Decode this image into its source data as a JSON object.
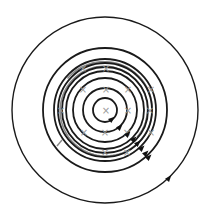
{
  "diagram": {
    "title": "Magnetic field lines around a coil (concentric circles with into-page markers)",
    "center": {
      "x": 105,
      "y": 110
    },
    "colors": {
      "field_line": "#1a1a1a",
      "coil": "#8a8a8a",
      "cross_marker": "#9a9a9a",
      "arrow": "#111111",
      "background": "#ffffff"
    },
    "field_lines": [
      {
        "r": 12,
        "arrow": {
          "x": 112,
          "y": 119,
          "angle": -40
        }
      },
      {
        "r": 22,
        "arrow": {
          "x": 120,
          "y": 127,
          "angle": -45
        }
      },
      {
        "r": 32,
        "arrow": {
          "x": 128,
          "y": 134,
          "angle": -45
        }
      },
      {
        "r": 39,
        "arrow": {
          "x": 134,
          "y": 139,
          "angle": -45
        }
      },
      {
        "r": 43,
        "arrow": {
          "x": 138,
          "y": 143,
          "angle": -45
        }
      },
      {
        "r": 47,
        "arrow": {
          "x": 142,
          "y": 148,
          "angle": -45
        }
      },
      {
        "r": 51,
        "arrow": {
          "x": 146,
          "y": 153,
          "angle": -45
        }
      },
      {
        "r": 62,
        "arrow": {
          "x": 149,
          "y": 157,
          "angle": -45
        }
      },
      {
        "r": 93,
        "arrow": {
          "x": 169,
          "y": 178,
          "angle": -50
        }
      }
    ],
    "coil_spiral": {
      "start_r": 42,
      "end_r": 49,
      "start_angle": -40,
      "end_angle": 140,
      "tail": {
        "x1": 62,
        "y1": 140,
        "x2": 57,
        "y2": 146
      }
    },
    "cross_markers": [
      {
        "x": 83,
        "y": 68
      },
      {
        "x": 106,
        "y": 68
      },
      {
        "x": 83,
        "y": 89
      },
      {
        "x": 106,
        "y": 89
      },
      {
        "x": 128,
        "y": 89
      },
      {
        "x": 151,
        "y": 89
      },
      {
        "x": 61,
        "y": 110
      },
      {
        "x": 106,
        "y": 110
      },
      {
        "x": 128,
        "y": 110
      },
      {
        "x": 150,
        "y": 110
      },
      {
        "x": 84,
        "y": 132
      },
      {
        "x": 105,
        "y": 132
      },
      {
        "x": 127,
        "y": 132
      },
      {
        "x": 151,
        "y": 132
      },
      {
        "x": 105,
        "y": 152
      },
      {
        "x": 127,
        "y": 152
      }
    ],
    "marker_symbol": "×",
    "icons": {
      "arrow": "arrowhead-icon",
      "marker": "cross-into-page-icon"
    }
  }
}
